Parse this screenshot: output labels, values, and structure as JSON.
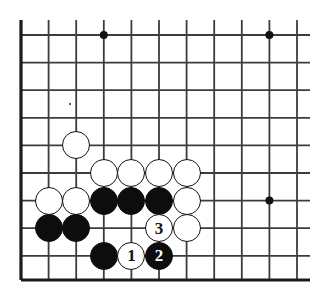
{
  "figure": {
    "kind": "go-board-diagram",
    "board_size": 19,
    "view": "bottom-left-corner",
    "colors": {
      "background": "#ffffff",
      "grid_line": "#3c3c3c",
      "border_line": "#1a1a1a",
      "black_stone": "#0d0d0d",
      "white_stone": "#ffffff",
      "white_stone_outline": "#111111",
      "star_point": "#111111"
    },
    "geometry": {
      "origin_x": 21,
      "origin_y": 35,
      "spacing": 27.6,
      "columns_x": [
        21,
        48.6,
        76.2,
        103.8,
        131.4,
        159,
        186.6,
        214.2,
        241.8,
        269.4,
        297
      ],
      "rows_y": [
        35,
        62.6,
        90.2,
        117.8,
        145.4,
        173,
        200.6,
        228.2,
        255.8,
        280
      ],
      "stone_radius": 14,
      "left_edge_x": 21,
      "right_edge_x": 310,
      "top_edge_y": 20,
      "bottom_edge_y": 280
    },
    "star_points": [
      {
        "name": "star-point-top",
        "x": 103.8,
        "y": 35
      },
      {
        "name": "star-point-top-right",
        "x": 269.4,
        "y": 35
      },
      {
        "name": "star-point-right",
        "x": 269.4,
        "y": 200.6
      }
    ],
    "speck": {
      "x": 69,
      "y": 103
    },
    "stones": [
      {
        "id": "white-s1",
        "color": "white",
        "x": 76.2,
        "y": 145.4,
        "label": ""
      },
      {
        "id": "white-s2",
        "color": "white",
        "x": 103.8,
        "y": 173,
        "label": ""
      },
      {
        "id": "white-s3",
        "color": "white",
        "x": 131.4,
        "y": 173,
        "label": ""
      },
      {
        "id": "white-s4",
        "color": "white",
        "x": 159,
        "y": 173,
        "label": ""
      },
      {
        "id": "white-s5",
        "color": "white",
        "x": 186.6,
        "y": 173,
        "label": ""
      },
      {
        "id": "white-s6",
        "color": "white",
        "x": 48.6,
        "y": 200.6,
        "label": ""
      },
      {
        "id": "white-s7",
        "color": "white",
        "x": 76.2,
        "y": 200.6,
        "label": ""
      },
      {
        "id": "black-s1",
        "color": "black",
        "x": 103.8,
        "y": 200.6,
        "label": ""
      },
      {
        "id": "black-s2",
        "color": "black",
        "x": 131.4,
        "y": 200.6,
        "label": ""
      },
      {
        "id": "black-s3",
        "color": "black",
        "x": 159,
        "y": 200.6,
        "label": ""
      },
      {
        "id": "white-s8",
        "color": "white",
        "x": 186.6,
        "y": 200.6,
        "label": ""
      },
      {
        "id": "black-s4",
        "color": "black",
        "x": 48.6,
        "y": 228.2,
        "label": ""
      },
      {
        "id": "black-s5",
        "color": "black",
        "x": 76.2,
        "y": 228.2,
        "label": ""
      },
      {
        "id": "move-3",
        "color": "white",
        "x": 159,
        "y": 228.2,
        "label": "3"
      },
      {
        "id": "white-s9",
        "color": "white",
        "x": 186.6,
        "y": 228.2,
        "label": ""
      },
      {
        "id": "black-s6",
        "color": "black",
        "x": 103.8,
        "y": 255.8,
        "label": ""
      },
      {
        "id": "move-1",
        "color": "white",
        "x": 131.4,
        "y": 255.8,
        "label": "1"
      },
      {
        "id": "move-2",
        "color": "black",
        "x": 159,
        "y": 255.8,
        "label": "2"
      }
    ],
    "move_sequence": [
      {
        "number": "1",
        "color": "white"
      },
      {
        "number": "2",
        "color": "black"
      },
      {
        "number": "3",
        "color": "white"
      }
    ]
  }
}
